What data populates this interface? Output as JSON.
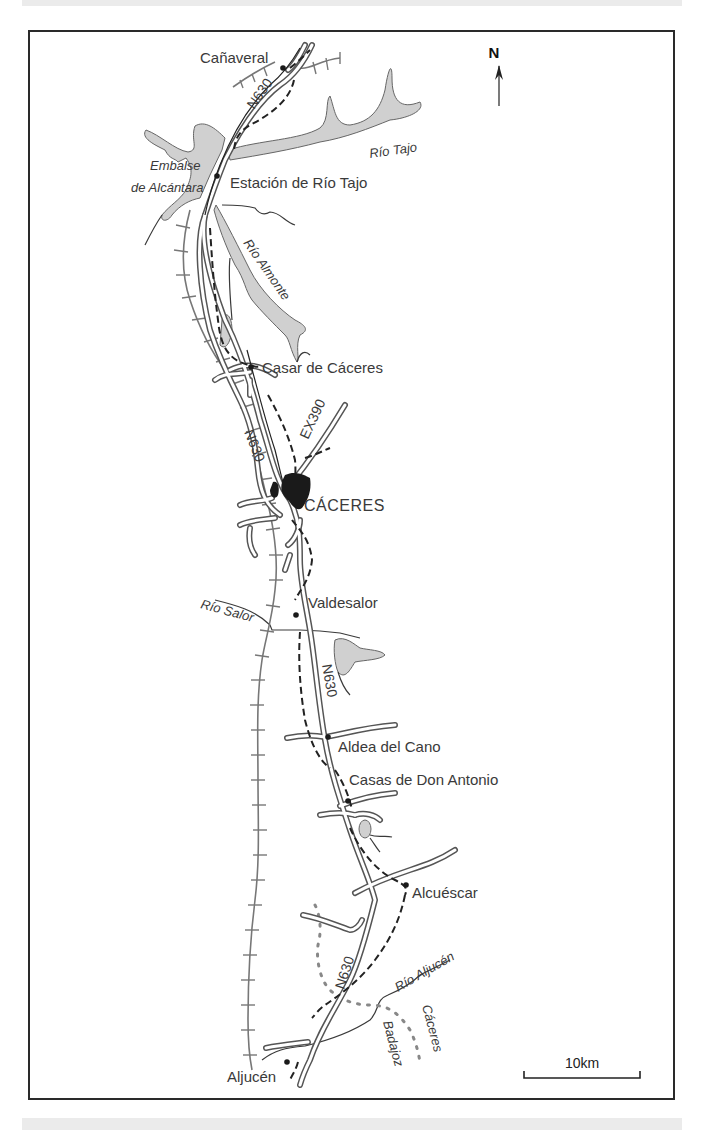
{
  "map": {
    "north_label": "N",
    "scale_label": "10km",
    "colors": {
      "water": "#d0d0d0",
      "ink": "#2a2a2a",
      "city": "#1a1a1a",
      "railway": "#777777",
      "road_outline": "#555555"
    },
    "towns": [
      {
        "name": "Cañaveral"
      },
      {
        "name": "Estación de Río Tajo"
      },
      {
        "name": "Casar de Cáceres"
      },
      {
        "name": "CÁCERES"
      },
      {
        "name": "Valdesalor"
      },
      {
        "name": "Aldea del Cano"
      },
      {
        "name": "Casas de Don Antonio"
      },
      {
        "name": "Alcuéscar"
      },
      {
        "name": "Aljucén"
      }
    ],
    "water_labels": [
      {
        "name": "Embalse"
      },
      {
        "name": "de Alcántara"
      },
      {
        "name": "Río Tajo"
      },
      {
        "name": "Río Almonte"
      },
      {
        "name": "Río Salor"
      },
      {
        "name": "Río Aljucén"
      }
    ],
    "road_labels": [
      {
        "name": "N630"
      },
      {
        "name": "N630"
      },
      {
        "name": "EX390"
      },
      {
        "name": "N630"
      },
      {
        "name": "N630"
      }
    ],
    "region_labels": [
      {
        "name": "Cáceres"
      },
      {
        "name": "Badajoz"
      }
    ]
  }
}
